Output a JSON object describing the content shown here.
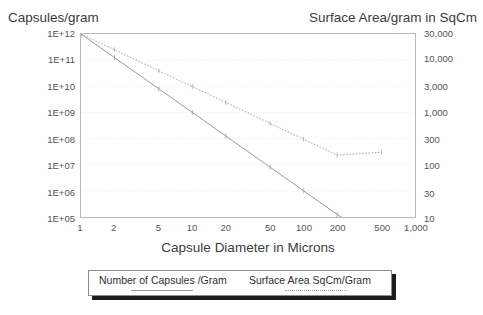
{
  "chart_data": {
    "type": "line",
    "title": "",
    "xlabel": "Capsule Diameter in Microns",
    "x_scale": "log",
    "xlim": [
      1,
      1000
    ],
    "x_ticks": [
      "1",
      "2",
      "5",
      "10",
      "20",
      "50",
      "100",
      "200",
      "500",
      "1,000"
    ],
    "x_tick_values": [
      1,
      2,
      5,
      10,
      20,
      50,
      100,
      200,
      500,
      1000
    ],
    "grid": true,
    "legend_position": "below-plot",
    "axes": [
      {
        "side": "left",
        "label": "Capsules/gram",
        "scale": "log",
        "ylim": [
          100000.0,
          1000000000000.0
        ],
        "ticks": [
          "1E+12",
          "1E+11",
          "1E+10",
          "1E+09",
          "1E+08",
          "1E+07",
          "1E+06",
          "1E+05"
        ],
        "tick_values": [
          1000000000000.0,
          100000000000.0,
          10000000000.0,
          1000000000.0,
          100000000.0,
          10000000.0,
          1000000.0,
          100000.0
        ]
      },
      {
        "side": "right",
        "label": "Surface Area/gram in SqCm",
        "scale": "log",
        "ylim": [
          10,
          30000
        ],
        "ticks": [
          "30,000",
          "10,000",
          "3,000",
          "1,000",
          "300",
          "100",
          "30",
          "10"
        ],
        "tick_values": [
          30000,
          10000,
          3000,
          1000,
          300,
          100,
          30,
          10
        ]
      }
    ],
    "series": [
      {
        "name": "Number of Capsules /Gram",
        "axis": "left",
        "style": "solid",
        "color": "#9a9a9a",
        "x": [
          1,
          2,
          5,
          10,
          20,
          50,
          100,
          200,
          500
        ],
        "y": [
          1000000000000.0,
          125000000000.0,
          8000000000.0,
          1000000000.0,
          125000000.0,
          8000000.0,
          1000000.0,
          125000.0,
          10000.0
        ]
      },
      {
        "name": "Surface Area SqCm/Gram",
        "axis": "right",
        "style": "dotted",
        "color": "#a8a8a8",
        "x": [
          1,
          2,
          5,
          10,
          20,
          50,
          100,
          200,
          500
        ],
        "y": [
          30000,
          15000,
          6000,
          3000,
          1500,
          600,
          300,
          150,
          170
        ]
      }
    ]
  },
  "legend": {
    "entries": [
      {
        "label": "Number of Capsules /Gram"
      },
      {
        "label": "Surface Area SqCm/Gram"
      }
    ]
  }
}
